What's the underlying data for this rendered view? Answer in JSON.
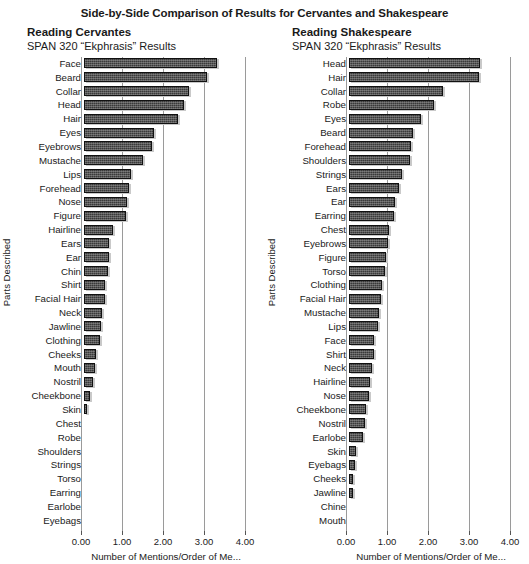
{
  "title": "Side-by-Side Comparison of Results for Cervantes and Shakespeare",
  "axis": {
    "ylabel": "Parts Described",
    "xlabel": "Number of Mentions/Order of Me...",
    "ticklabels": [
      "0.00",
      "1.00",
      "2.00",
      "3.00",
      "4.00"
    ],
    "tickvalues": [
      0,
      1,
      2,
      3,
      4
    ]
  },
  "colors": {
    "bar": "#3a3a3a",
    "bar_border": "#111111",
    "bar_shadow": "#c9c9c9",
    "gridline": "#9a9a9a",
    "text": "#1a1a1a"
  },
  "panels": [
    {
      "title": "Reading Cervantes",
      "subtitle": "SPAN 320 “Ekphrasis” Results"
    },
    {
      "title": "Reading Shakespeare",
      "subtitle": "SPAN 320 “Ekphrasis” Results"
    }
  ],
  "chart_data": [
    {
      "type": "bar",
      "orientation": "horizontal",
      "title": "Reading Cervantes",
      "subtitle": "SPAN 320 “Ekphrasis” Results",
      "xlabel": "Number of Mentions/Order of Me...",
      "ylabel": "Parts Described",
      "xlim": [
        0,
        4
      ],
      "xticks": [
        0,
        1,
        2,
        3,
        4
      ],
      "grid": true,
      "legend": "none",
      "categories": [
        "Face",
        "Beard",
        "Collar",
        "Head",
        "Hair",
        "Eyes",
        "Eyebrows",
        "Mustache",
        "Lips",
        "Forehead",
        "Nose",
        "Figure",
        "Hairline",
        "Ears",
        "Ear",
        "Chin",
        "Shirt",
        "Facial Hair",
        "Neck",
        "Jawline",
        "Clothing",
        "Cheeks",
        "Mouth",
        "Nostril",
        "Cheekbone",
        "Skin",
        "Chest",
        "Robe",
        "Shoulders",
        "Strings",
        "Torso",
        "Earring",
        "Earlobe",
        "Eyebags"
      ],
      "values": [
        3.25,
        3.0,
        2.55,
        2.45,
        2.3,
        1.7,
        1.65,
        1.45,
        1.15,
        1.1,
        1.05,
        1.02,
        0.7,
        0.62,
        0.6,
        0.58,
        0.52,
        0.5,
        0.45,
        0.42,
        0.38,
        0.3,
        0.26,
        0.22,
        0.15,
        0.08,
        0,
        0,
        0,
        0,
        0,
        0,
        0,
        0
      ]
    },
    {
      "type": "bar",
      "orientation": "horizontal",
      "title": "Reading Shakespeare",
      "subtitle": "SPAN 320 “Ekphrasis” Results",
      "xlabel": "Number of Mentions/Order of Me...",
      "ylabel": "Parts Described",
      "xlim": [
        0,
        4
      ],
      "xticks": [
        0,
        1,
        2,
        3,
        4
      ],
      "grid": true,
      "legend": "none",
      "categories": [
        "Head",
        "Hair",
        "Collar",
        "Robe",
        "Eyes",
        "Beard",
        "Forehead",
        "Shoulders",
        "Strings",
        "Ears",
        "Ear",
        "Earring",
        "Chest",
        "Eyebrows",
        "Figure",
        "Torso",
        "Clothing",
        "Facial Hair",
        "Mustache",
        "Lips",
        "Face",
        "Shirt",
        "Neck",
        "Hairline",
        "Nose",
        "Cheekbone",
        "Nostril",
        "Earlobe",
        "Skin",
        "Eyebags",
        "Cheeks",
        "Jawline",
        "Chine",
        "Mouth"
      ],
      "values": [
        3.2,
        3.18,
        2.3,
        2.08,
        1.75,
        1.55,
        1.5,
        1.48,
        1.3,
        1.22,
        1.12,
        1.1,
        0.98,
        0.95,
        0.9,
        0.88,
        0.8,
        0.78,
        0.74,
        0.7,
        0.62,
        0.6,
        0.55,
        0.52,
        0.48,
        0.42,
        0.38,
        0.34,
        0.16,
        0.14,
        0.1,
        0.09,
        0,
        0
      ]
    }
  ]
}
